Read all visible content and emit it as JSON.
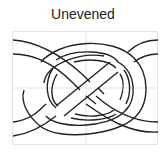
{
  "title": "Unevened",
  "figure": {
    "kind": "knot-diagram",
    "frame": {
      "x": 12,
      "y": 31,
      "width": 146,
      "height": 114
    },
    "grid": {
      "vertical_x": 86,
      "horizontal_y": 88
    },
    "colors": {
      "stroke": "#222222",
      "grid": "#e0e0e0",
      "background": "#ffffff"
    }
  }
}
